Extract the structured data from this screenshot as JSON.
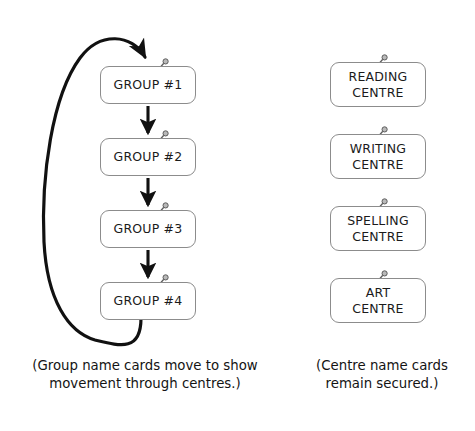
{
  "diagram": {
    "background_color": "#ffffff",
    "line_color": "#111111",
    "card_border_color": "#8c8c8c",
    "card_fill_color": "#ffffff",
    "pin_icon_name": "push-pin-icon"
  },
  "group_column": {
    "heading": "",
    "cards": [
      {
        "label": "GROUP #1",
        "pin": "push-pin-icon"
      },
      {
        "label": "GROUP #2",
        "pin": "push-pin-icon"
      },
      {
        "label": "GROUP #3",
        "pin": "push-pin-icon"
      },
      {
        "label": "GROUP #4",
        "pin": "push-pin-icon"
      }
    ],
    "caption_line1": "(Group name cards move to show",
    "caption_line2": "movement through centres.)"
  },
  "centre_column": {
    "heading": "",
    "cards": [
      {
        "line1": "READING",
        "line2": "CENTRE",
        "pin": "push-pin-icon"
      },
      {
        "line1": "WRITING",
        "line2": "CENTRE",
        "pin": "push-pin-icon"
      },
      {
        "line1": "SPELLING",
        "line2": "CENTRE",
        "pin": "push-pin-icon"
      },
      {
        "line1": "ART",
        "line2": "CENTRE",
        "pin": "push-pin-icon"
      }
    ],
    "caption_line1": "(Centre name cards",
    "caption_line2": "remain secured.)"
  },
  "arrows": {
    "straight": [
      {
        "from": "GROUP #1",
        "to": "GROUP #2"
      },
      {
        "from": "GROUP #2",
        "to": "GROUP #3"
      },
      {
        "from": "GROUP #3",
        "to": "GROUP #4"
      }
    ],
    "loop": {
      "from": "GROUP #4",
      "to": "GROUP #1",
      "style": "curved-wraparound"
    }
  }
}
